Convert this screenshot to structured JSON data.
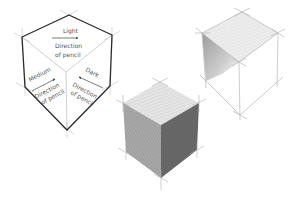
{
  "diagram": {
    "type": "pencil-shading-cubes",
    "labeled_cube": {
      "faces": [
        {
          "face": "top",
          "tone_label": "Light",
          "direction_label_line1": "Direction",
          "direction_label_line2": "of pencil"
        },
        {
          "face": "left",
          "tone_label": "Medium",
          "direction_label_line1": "Direction",
          "direction_label_line2": "of pencil"
        },
        {
          "face": "right",
          "tone_label": "Dark",
          "direction_label_line1": "Direction",
          "direction_label_line2": "of pencil"
        }
      ]
    },
    "cubes": [
      {
        "name": "labeled-outline-cube",
        "description": "Hexagon outline with tone labels and pencil direction arrows"
      },
      {
        "name": "partially-shaded-cube",
        "description": "Construction wireframe cube with light top hatching and shaded left edge"
      },
      {
        "name": "fully-shaded-cube",
        "description": "Construction cube with light top, medium left, dark right faces"
      }
    ],
    "colors": {
      "outline": "#2a2a2a",
      "construction": "#b8b8b8",
      "light": "#e2e2e2",
      "medium": "#a3a3a3",
      "dark": "#6a6a6a"
    }
  }
}
